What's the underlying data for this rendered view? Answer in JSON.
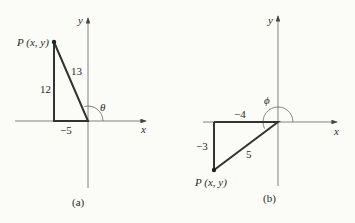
{
  "panels": [
    {
      "id": "a",
      "caption": "(a)",
      "x_axis_label": "x",
      "y_axis_label": "y",
      "point_label": "P (x, y)",
      "angle_label": "θ",
      "hypotenuse_label": "13",
      "vertical_leg_label": "12",
      "horizontal_leg_label": "−5"
    },
    {
      "id": "b",
      "caption": "(b)",
      "x_axis_label": "x",
      "y_axis_label": "y",
      "point_label": "P (x, y)",
      "angle_label": "ϕ",
      "hypotenuse_label": "5",
      "vertical_leg_label": "−3",
      "horizontal_leg_label": "−4"
    }
  ],
  "colors": {
    "axis": "#555555",
    "triangle": "#333333",
    "background": "#fbfbf8"
  }
}
